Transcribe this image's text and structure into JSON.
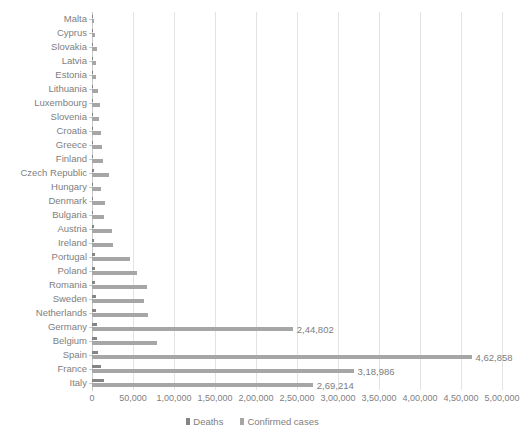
{
  "chart_data": {
    "type": "bar",
    "orientation": "horizontal",
    "title": "",
    "subtitle": "",
    "xlabel": "",
    "ylabel": "",
    "xlim": [
      0,
      500000
    ],
    "grid": true,
    "legend_position": "bottom",
    "xtick_labels": [
      "0",
      "50,000",
      "1,00,000",
      "1,50,000",
      "2,00,000",
      "2,50,000",
      "3,00,000",
      "3,50,000",
      "4,00,000",
      "4,50,000",
      "5,00,000"
    ],
    "xtick_values": [
      0,
      50000,
      100000,
      150000,
      200000,
      250000,
      300000,
      350000,
      400000,
      450000,
      500000
    ],
    "categories": [
      "Malta",
      "Cyprus",
      "Slovakia",
      "Latvia",
      "Estonia",
      "Lithuania",
      "Luxembourg",
      "Slovenia",
      "Croatia",
      "Greece",
      "Finland",
      "Czech Republic",
      "Hungary",
      "Denmark",
      "Bulgaria",
      "Austria",
      "Ireland",
      "Portugal",
      "Poland",
      "Romania",
      "Sweden",
      "Netherlands",
      "Germany",
      "Belgium",
      "Spain",
      "France",
      "Italy"
    ],
    "series": [
      {
        "name": "Deaths",
        "color": "#858585",
        "values": [
          120,
          95,
          330,
          220,
          180,
          290,
          410,
          360,
          520,
          640,
          780,
          1850,
          1010,
          1620,
          1450,
          2400,
          2650,
          3100,
          3420,
          3950,
          4300,
          4800,
          5900,
          6200,
          7800,
          11400,
          14800
        ]
      },
      {
        "name": "Confirmed cases",
        "color": "#a6a6a6",
        "values": [
          2400,
          3100,
          6200,
          5400,
          4800,
          7900,
          9500,
          8700,
          11500,
          12800,
          13200,
          20400,
          10800,
          15600,
          14200,
          24600,
          25400,
          46800,
          55300,
          66500,
          63800,
          68200,
          244802,
          79500,
          462858,
          318986,
          269214
        ]
      }
    ],
    "data_labels": [
      {
        "category": "Germany",
        "series": "Confirmed cases",
        "text": "2,44,802"
      },
      {
        "category": "Spain",
        "series": "Confirmed cases",
        "text": "4,62,858"
      },
      {
        "category": "France",
        "series": "Confirmed cases",
        "text": "3,18,986"
      },
      {
        "category": "Italy",
        "series": "Confirmed cases",
        "text": "2,69,214"
      }
    ]
  },
  "legend": {
    "items": [
      {
        "label": "Deaths",
        "color": "#858585"
      },
      {
        "label": "Confirmed cases",
        "color": "#a6a6a6"
      }
    ]
  }
}
